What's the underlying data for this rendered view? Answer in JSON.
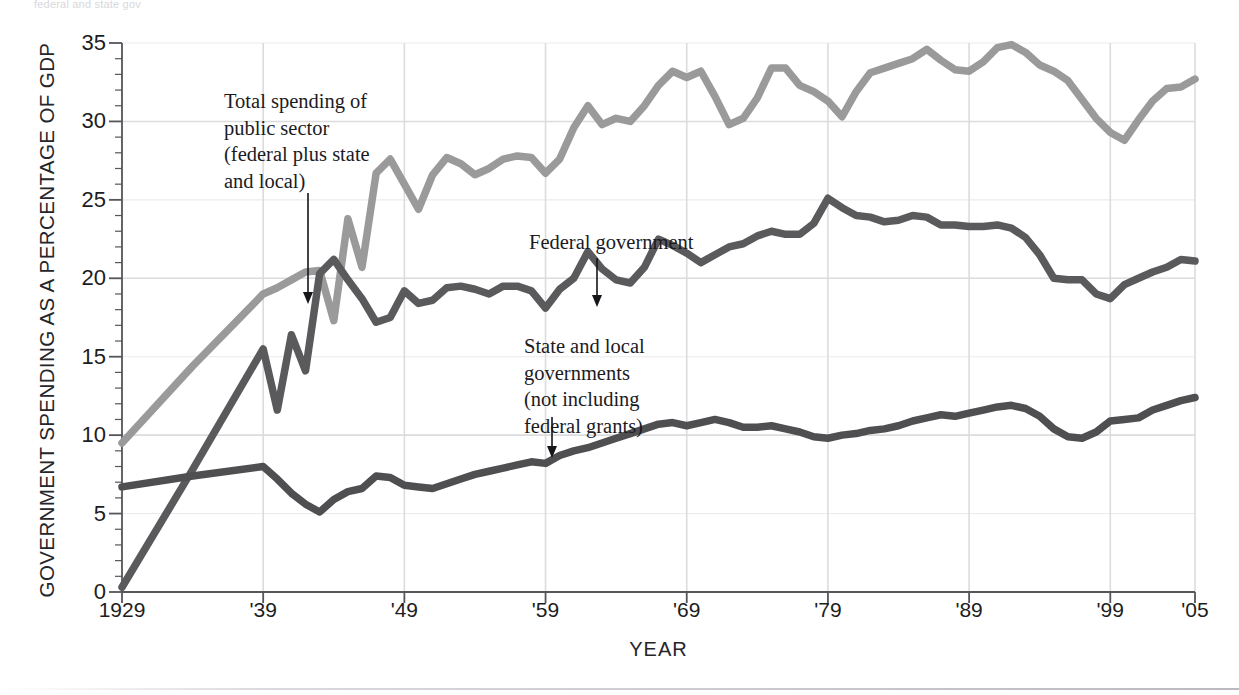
{
  "figure": {
    "faint_top_caption": "federal and state gov",
    "bottom_rule": "horizontal-rule"
  },
  "chart_data": {
    "type": "line",
    "title": "",
    "xlabel": "YEAR",
    "ylabel": "GOVERNMENT SPENDING AS A PERCENTAGE OF GDP",
    "xlim": [
      1929,
      2005
    ],
    "ylim": [
      0,
      35
    ],
    "grid": "major-gridlines-at-10-20-30-and-decade-years",
    "legend_position": "inline-annotations",
    "y_ticks": [
      0,
      5,
      10,
      15,
      20,
      25,
      30,
      35
    ],
    "y_tick_labels": [
      "0",
      "5",
      "10",
      "15",
      "20",
      "25",
      "30",
      "35"
    ],
    "x_ticks": [
      1929,
      1939,
      1949,
      1959,
      1969,
      1979,
      1989,
      1999,
      2005
    ],
    "x_tick_labels": [
      "1929",
      "'39",
      "'49",
      "'59",
      "'69",
      "'79",
      "'89",
      "'99",
      "'05"
    ],
    "colors": {
      "total": "#9a9a9a",
      "federal": "#5a5a5c",
      "state_local": "#4f4f51",
      "gridline": "#dcdcde",
      "axis": "#55555a",
      "text": "#1d1d21"
    },
    "annotations": [
      {
        "id": "total",
        "text": "Total spending of\npublic sector\n(federal plus state\nand local)",
        "arrow": "down"
      },
      {
        "id": "federal",
        "text": "Federal government",
        "arrow": "down"
      },
      {
        "id": "state_local",
        "text": "State and local\ngovernments\n(not including\nfederal grants)",
        "arrow": "down"
      }
    ],
    "x": [
      1929,
      1934,
      1939,
      1940,
      1941,
      1942,
      1943,
      1944,
      1945,
      1946,
      1947,
      1948,
      1949,
      1950,
      1951,
      1952,
      1953,
      1954,
      1955,
      1956,
      1957,
      1958,
      1959,
      1960,
      1961,
      1962,
      1963,
      1964,
      1965,
      1966,
      1967,
      1968,
      1969,
      1970,
      1971,
      1972,
      1973,
      1974,
      1975,
      1976,
      1977,
      1978,
      1979,
      1980,
      1981,
      1982,
      1983,
      1984,
      1985,
      1986,
      1987,
      1988,
      1989,
      1990,
      1991,
      1992,
      1993,
      1994,
      1995,
      1996,
      1997,
      1998,
      1999,
      2000,
      2001,
      2002,
      2003,
      2004,
      2005
    ],
    "series": [
      {
        "name": "Total spending of public sector (federal plus state and local)",
        "key": "total",
        "color": "#9a9a9a",
        "values": [
          9.5,
          14.4,
          19.0,
          19.4,
          19.9,
          20.4,
          20.5,
          17.3,
          23.8,
          20.7,
          26.7,
          27.6,
          26.0,
          24.4,
          26.6,
          27.7,
          27.3,
          26.6,
          27.0,
          27.6,
          27.8,
          27.7,
          26.7,
          27.6,
          29.6,
          31.0,
          29.8,
          30.2,
          30.0,
          31.0,
          32.3,
          33.2,
          32.8,
          33.2,
          31.6,
          29.8,
          30.2,
          31.5,
          33.4,
          33.4,
          32.3,
          31.9,
          31.3,
          30.3,
          31.9,
          33.1,
          33.4,
          33.7,
          34.0,
          34.6,
          33.9,
          33.3,
          33.2,
          33.8,
          34.7,
          34.9,
          34.4,
          33.6,
          33.2,
          32.6,
          31.4,
          30.2,
          29.3,
          28.8,
          30.1,
          31.3,
          32.1,
          32.2,
          32.7
        ]
      },
      {
        "name": "Federal government",
        "key": "federal",
        "color": "#5a5a5c",
        "values": [
          0.3,
          7.8,
          15.5,
          11.6,
          16.4,
          14.1,
          20.3,
          21.2,
          19.9,
          18.7,
          17.2,
          17.5,
          19.2,
          18.4,
          18.6,
          19.4,
          19.5,
          19.3,
          19.0,
          19.5,
          19.5,
          19.2,
          18.1,
          19.3,
          20.0,
          21.7,
          20.6,
          19.9,
          19.7,
          20.7,
          22.5,
          22.1,
          21.6,
          21.0,
          21.5,
          22.0,
          22.2,
          22.7,
          23.0,
          22.8,
          22.8,
          23.5,
          25.1,
          24.5,
          24.0,
          23.9,
          23.6,
          23.7,
          24.0,
          23.9,
          23.4,
          23.4,
          23.3,
          23.3,
          23.4,
          23.2,
          22.6,
          21.5,
          20.0,
          19.9,
          19.9,
          19.0,
          18.7,
          19.6,
          20.0,
          20.4,
          20.7,
          21.2,
          21.1
        ]
      },
      {
        "name": "State and local governments (not including federal grants)",
        "key": "state_local",
        "color": "#4f4f51",
        "values": [
          6.7,
          7.4,
          8.0,
          7.2,
          6.3,
          5.6,
          5.1,
          5.9,
          6.4,
          6.6,
          7.4,
          7.3,
          6.8,
          6.7,
          6.6,
          6.9,
          7.2,
          7.5,
          7.7,
          7.9,
          8.1,
          8.3,
          8.2,
          8.7,
          9.0,
          9.2,
          9.5,
          9.8,
          10.1,
          10.4,
          10.7,
          10.8,
          10.6,
          10.8,
          11.0,
          10.8,
          10.5,
          10.5,
          10.6,
          10.4,
          10.2,
          9.9,
          9.8,
          10.0,
          10.1,
          10.3,
          10.4,
          10.6,
          10.9,
          11.1,
          11.3,
          11.2,
          11.4,
          11.6,
          11.8,
          11.9,
          11.7,
          11.2,
          10.4,
          9.9,
          9.8,
          10.2,
          10.9,
          11.0,
          11.1,
          11.6,
          11.9,
          12.2,
          12.4
        ]
      }
    ]
  }
}
